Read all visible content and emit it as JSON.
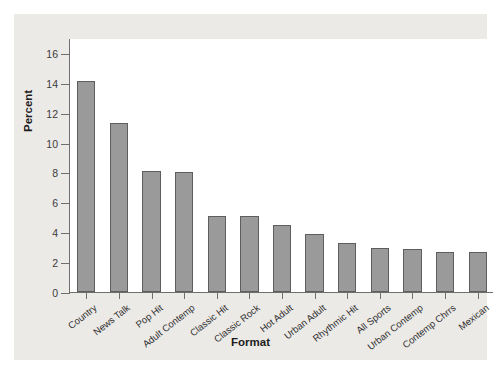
{
  "chart_data": {
    "type": "bar",
    "title": "",
    "xlabel": "Format",
    "ylabel": "Percent",
    "categories": [
      "Country",
      "News Talk",
      "Pop Hit",
      "Adult Contemp",
      "Classic Hit",
      "Classic Rock",
      "Hot Adult",
      "Urban Adult",
      "Rhythmic Hit",
      "All Sports",
      "Urban Contemp",
      "Contemp Chrrs",
      "Mexican"
    ],
    "values": [
      14.1,
      11.3,
      8.1,
      8.0,
      5.1,
      5.1,
      4.5,
      3.9,
      3.25,
      2.95,
      2.85,
      2.7,
      2.7
    ],
    "ylim": [
      0,
      17
    ],
    "yticks": [
      0,
      2,
      4,
      6,
      8,
      10,
      12,
      14,
      16
    ],
    "ytick_labels": [
      "0",
      "2",
      "4",
      "6",
      "8",
      "10",
      "12",
      "14",
      "16"
    ],
    "grid": false,
    "legend": false,
    "bar_color": "#9a9a9a",
    "bar_edge_color": "#5e5e5e",
    "plot_background": "#ffffff",
    "figure_background": "#eceae7"
  }
}
